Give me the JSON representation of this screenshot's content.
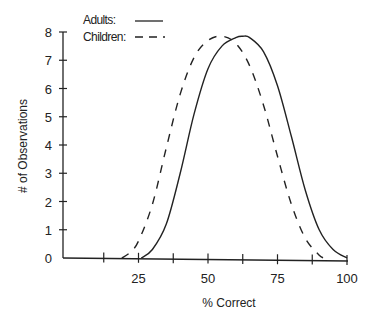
{
  "chart_data": {
    "type": "line",
    "title": "",
    "xlabel": "% Correct",
    "ylabel": "# of Observations",
    "xlim": [
      0,
      100
    ],
    "ylim": [
      0,
      8
    ],
    "x_ticks": [
      25,
      50,
      75,
      100
    ],
    "x_minor_ticks": [
      12.5,
      25,
      37.5,
      50,
      62.5,
      75,
      87.5,
      100
    ],
    "y_ticks": [
      0,
      1,
      2,
      3,
      4,
      5,
      6,
      7,
      8
    ],
    "grid": false,
    "legend_position": "top-left",
    "series": [
      {
        "name": "Adults:",
        "style": "solid",
        "x": [
          26,
          30,
          35,
          40,
          45,
          50,
          55,
          60,
          62.5,
          65,
          70,
          75,
          80,
          85,
          90,
          95,
          100
        ],
        "y": [
          0,
          0.3,
          1.2,
          3.0,
          5.1,
          6.7,
          7.5,
          7.8,
          7.85,
          7.8,
          7.3,
          6.1,
          4.3,
          2.4,
          1.0,
          0.3,
          0
        ]
      },
      {
        "name": "Children:",
        "style": "dashed",
        "x": [
          19,
          22,
          25,
          30,
          35,
          40,
          45,
          50,
          55,
          60,
          65,
          70,
          75,
          80,
          85,
          90,
          92
        ],
        "y": [
          0,
          0.2,
          0.6,
          1.9,
          3.9,
          5.8,
          7.1,
          7.7,
          7.85,
          7.6,
          6.8,
          5.4,
          3.6,
          1.9,
          0.7,
          0.1,
          0
        ]
      }
    ]
  },
  "labels": {
    "y_ticks": [
      "0",
      "1",
      "2",
      "3",
      "4",
      "5",
      "6",
      "7",
      "8"
    ],
    "x_ticks": [
      "25",
      "50",
      "75",
      "100"
    ],
    "xlabel": "% Correct",
    "ylabel": "# of Observations",
    "legend_adults": "Adults:",
    "legend_children": "Children:"
  }
}
